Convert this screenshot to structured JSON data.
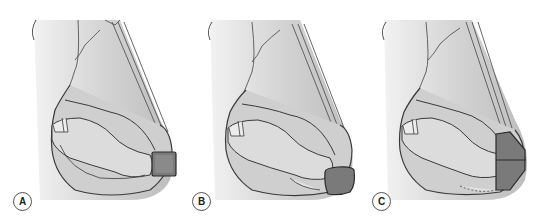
{
  "figure": {
    "panels": [
      {
        "id": "A",
        "label": "A",
        "description": "Nasal tip with rectangular graft positioned at the tip"
      },
      {
        "id": "B",
        "label": "B",
        "description": "Nasal tip with rounded shield graft sutured at the tip"
      },
      {
        "id": "C",
        "label": "C",
        "description": "Nasal tip with graft covering columella and tip, dashed suture line along lower columella"
      }
    ],
    "colors": {
      "background": "#ffffff",
      "skin_light": "#e2e2e2",
      "skin_mid": "#c4c4c4",
      "skin_dark": "#8e8e8e",
      "outline": "#3a3a3a",
      "graft": "#7a7a7a"
    }
  }
}
